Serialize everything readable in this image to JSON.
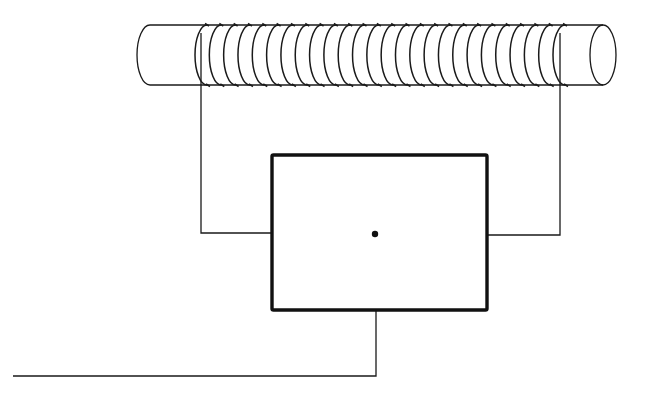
{
  "diagram": {
    "type": "schematic",
    "colors": {
      "background": "#ffffff",
      "ink": "#1a1a1a"
    },
    "cylinder": {
      "x_left": 150,
      "x_right": 603,
      "y_top": 25,
      "y_bottom": 85,
      "end_radius_x": 13
    },
    "coil": {
      "turns": 26,
      "x_start": 205,
      "x_end": 563,
      "arc_radius_x": 12
    },
    "box": {
      "x": 272,
      "y": 155,
      "width": 215,
      "height": 155,
      "center_dot": {
        "cx": 375,
        "cy": 234,
        "r": 3.2
      }
    },
    "leads": {
      "left": {
        "points": [
          [
            201,
            85
          ],
          [
            201,
            233
          ],
          [
            272,
            233
          ]
        ]
      },
      "right": {
        "points": [
          [
            560,
            85
          ],
          [
            560,
            235
          ],
          [
            487,
            235
          ]
        ]
      },
      "output": {
        "points": [
          [
            376,
            310
          ],
          [
            376,
            376
          ],
          [
            13,
            376
          ]
        ]
      }
    },
    "labels": []
  }
}
